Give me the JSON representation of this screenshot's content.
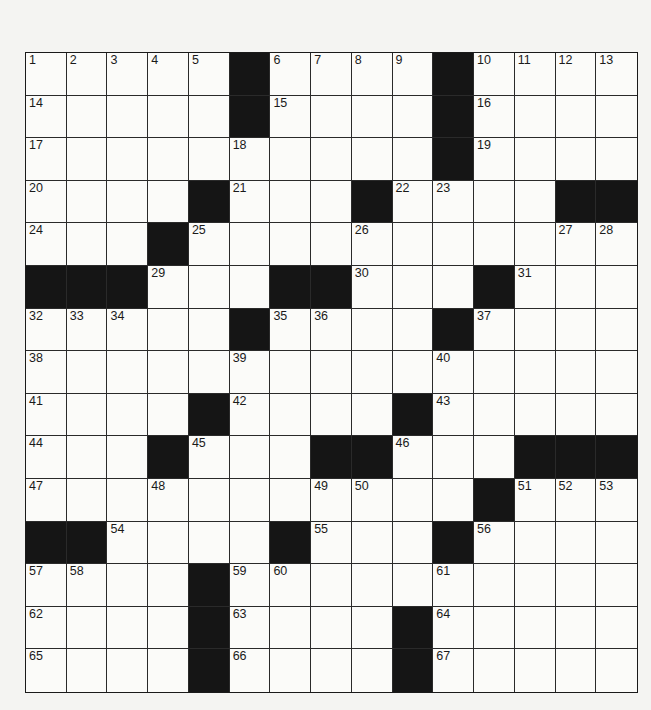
{
  "puzzle": {
    "rows": 15,
    "cols": 15,
    "grid": [
      [
        "1",
        "2",
        "3",
        "4",
        "5",
        "#",
        "6",
        "7",
        "8",
        "9",
        "#",
        "10",
        "11",
        "12",
        "13"
      ],
      [
        "14",
        "",
        "",
        "",
        "",
        "#",
        "15",
        "",
        "",
        "",
        "#",
        "16",
        "",
        "",
        ""
      ],
      [
        "17",
        "",
        "",
        "",
        "",
        "18",
        "",
        "",
        "",
        "",
        "#",
        "19",
        "",
        "",
        ""
      ],
      [
        "20",
        "",
        "",
        "",
        "#",
        "21",
        "",
        "",
        "#",
        "22",
        "23",
        "",
        "",
        "#",
        "#"
      ],
      [
        "24",
        "",
        "",
        "#",
        "25",
        "",
        "",
        "",
        "26",
        "",
        "",
        "",
        "",
        "27",
        "28"
      ],
      [
        "#",
        "#",
        "#",
        "29",
        "",
        "",
        "#",
        "#",
        "30",
        "",
        "",
        "#",
        "31",
        "",
        ""
      ],
      [
        "32",
        "33",
        "34",
        "",
        "",
        "#",
        "35",
        "36",
        "",
        "",
        "#",
        "37",
        "",
        "",
        ""
      ],
      [
        "38",
        "",
        "",
        "",
        "",
        "39",
        "",
        "",
        "",
        "",
        "40",
        "",
        "",
        "",
        ""
      ],
      [
        "41",
        "",
        "",
        "",
        "#",
        "42",
        "",
        "",
        "",
        "#",
        "43",
        "",
        "",
        "",
        ""
      ],
      [
        "44",
        "",
        "",
        "#",
        "45",
        "",
        "",
        "#",
        "#",
        "46",
        "",
        "",
        "#",
        "#",
        "#"
      ],
      [
        "47",
        "",
        "",
        "48",
        "",
        "",
        "",
        "49",
        "50",
        "",
        "",
        "#",
        "51",
        "52",
        "53"
      ],
      [
        "#",
        "#",
        "54",
        "",
        "",
        "",
        "#",
        "55",
        "",
        "",
        "#",
        "56",
        "",
        "",
        ""
      ],
      [
        "57",
        "58",
        "",
        "",
        "#",
        "59",
        "60",
        "",
        "",
        "",
        "61",
        "",
        "",
        "",
        ""
      ],
      [
        "62",
        "",
        "",
        "",
        "#",
        "63",
        "",
        "",
        "",
        "#",
        "64",
        "",
        "",
        "",
        ""
      ],
      [
        "65",
        "",
        "",
        "",
        "#",
        "66",
        "",
        "",
        "",
        "#",
        "67",
        "",
        "",
        "",
        ""
      ]
    ],
    "colors": {
      "black_square": "#151515",
      "white_square": "#fbfbf9",
      "grid_line": "#2a2a2a"
    }
  }
}
